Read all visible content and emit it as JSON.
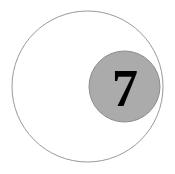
{
  "figure": {
    "background_color": "#ffffff",
    "width": 175,
    "height": 174,
    "outer_circle": {
      "label": "outer circle",
      "fill_color": "#ffffff",
      "stroke_color": "#999999",
      "stroke_width": 1,
      "center_x": 87.5,
      "center_y": 86.5,
      "radius": 75.5
    },
    "inner_circle": {
      "label": "inner shaded circle",
      "fill_color": "#ababab",
      "stroke_color": "#8c8c8c",
      "stroke_width": 1,
      "center_x": 124.5,
      "center_y": 86.5,
      "radius": 35.5
    },
    "digit": {
      "text": "7",
      "color": "#000000",
      "font_size": 52,
      "center_x": 125,
      "baseline_y": 106
    }
  }
}
